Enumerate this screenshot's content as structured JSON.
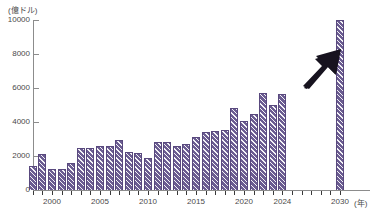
{
  "chart_data": {
    "type": "bar",
    "title": "",
    "subtitle": "",
    "xlabel": "年",
    "ylabel": "億ドル",
    "unit_label": "(億ドル)",
    "x_unit_label": "(年)",
    "ylim": [
      0,
      10000
    ],
    "ytick_labels": [
      "0",
      "2000",
      "4000",
      "6000",
      "8000",
      "10000"
    ],
    "yticks": [
      0,
      2000,
      4000,
      6000,
      8000,
      10000
    ],
    "xtick_labels": [
      "2000",
      "2005",
      "2010",
      "2015",
      "2020",
      "2024",
      "2030"
    ],
    "xticks": [
      2000,
      2005,
      2010,
      2015,
      2020,
      2024,
      2030
    ],
    "grid": false,
    "legend": null,
    "series_color": "#6b5c91",
    "annotation_color": "#17131f",
    "annotation": "up-right-arrow",
    "categories": [
      "1998",
      "1999",
      "2000",
      "2001",
      "2002",
      "2003",
      "2004",
      "2005",
      "2006",
      "2007",
      "2008",
      "2009",
      "2010",
      "2011",
      "2012",
      "2013",
      "2014",
      "2015",
      "2016",
      "2017",
      "2018",
      "2019",
      "2020",
      "2021",
      "2022",
      "2023",
      "2024",
      "2030"
    ],
    "values": [
      1400,
      2100,
      1250,
      1250,
      1600,
      2450,
      2500,
      2600,
      2600,
      2950,
      2250,
      2200,
      1900,
      2800,
      2800,
      2600,
      2700,
      3100,
      3400,
      3500,
      3550,
      4800,
      4050,
      4500,
      5700,
      5000,
      5650,
      10000
    ]
  }
}
